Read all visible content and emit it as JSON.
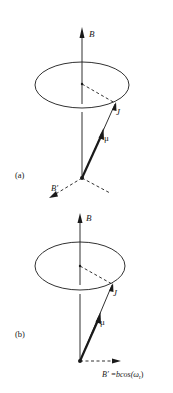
{
  "panels": [
    {
      "id": "a",
      "label": "(a)",
      "field_label": "B",
      "angular_momentum_label": "J",
      "magnetic_moment_label": "μ",
      "perturbing_field_label": "B′"
    },
    {
      "id": "b",
      "label": "(b)",
      "field_label": "B",
      "angular_momentum_label": "J",
      "magnetic_moment_label": "μ",
      "perturbing_field_label": "B′ =bcos(ω",
      "perturbing_field_subscript": "r",
      "perturbing_field_close": ")"
    }
  ],
  "colors": {
    "stroke": "#1a1a1a",
    "background": "#ffffff"
  }
}
